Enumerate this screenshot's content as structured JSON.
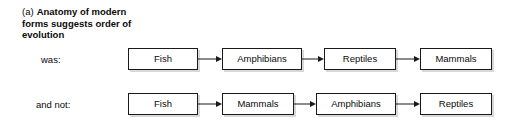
{
  "figure": {
    "caption_marker": "(a)",
    "caption_text": "Anatomy of modern forms suggests order of evolution",
    "rows": [
      {
        "label": "was:",
        "nodes": [
          "Fish",
          "Amphibians",
          "Reptiles",
          "Mammals"
        ]
      },
      {
        "label": "and not:",
        "nodes": [
          "Fish",
          "Mammals",
          "Amphibians",
          "Reptiles"
        ]
      }
    ]
  },
  "colors": {
    "background": "#ffffff",
    "text": "#0a0a0a",
    "box_border": "#1a1a1a",
    "box_fill": "#ffffff",
    "box_shadow": "#d8d8d8",
    "arrow": "#1a1a1a"
  },
  "icons": {
    "arrow_right": "arrow-right-icon"
  }
}
